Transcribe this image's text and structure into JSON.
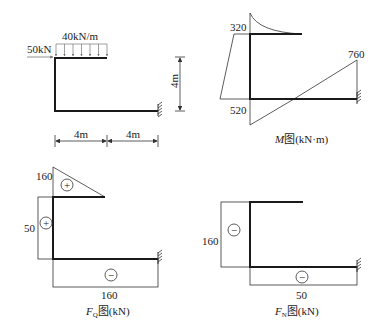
{
  "loading_diagram": {
    "point_load": "50kN",
    "distributed_load": "40kN/m",
    "height_dim": "4m",
    "span_dims": [
      "4m",
      "4m"
    ]
  },
  "moment_diagram": {
    "caption_var": "M",
    "caption_rest": "图(kN·m)",
    "values": {
      "top_corner": "320",
      "bottom_corner": "520",
      "support": "760"
    }
  },
  "shear_diagram": {
    "caption_var": "F",
    "caption_sub": "Q",
    "caption_rest": "图(kN)",
    "values": {
      "top_beam": "160",
      "column": "50",
      "bottom_beam": "160"
    },
    "signs": {
      "top_beam": "+",
      "column": "+",
      "bottom_beam": "−"
    }
  },
  "axial_diagram": {
    "caption_var": "F",
    "caption_sub": "N",
    "caption_rest": "图(kN)",
    "values": {
      "column": "160",
      "bottom_beam": "50"
    },
    "signs": {
      "column": "−",
      "bottom_beam": "−"
    }
  }
}
